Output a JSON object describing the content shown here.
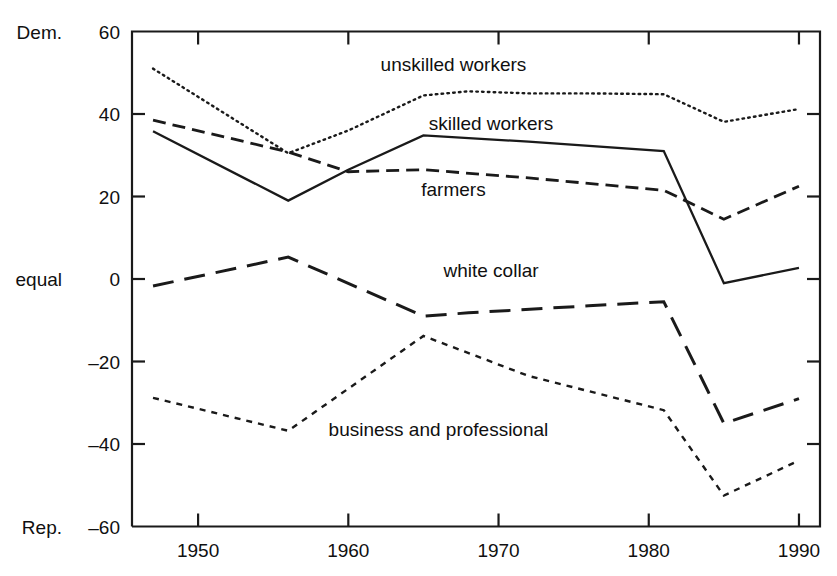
{
  "chart_data": {
    "type": "line",
    "title": "",
    "subtitle": "",
    "xlabel": "",
    "ylabel": "",
    "xlim": [
      1945.6,
      1991.4
    ],
    "ylim": [
      -60,
      60
    ],
    "grid": false,
    "legend_position": "inline-annotations",
    "x_ticks": [
      "1950",
      "1960",
      "1970",
      "1980",
      "1990"
    ],
    "x_tick_values": [
      1950,
      1960,
      1970,
      1980,
      1990
    ],
    "y_ticks": [
      "60",
      "40",
      "20",
      "0",
      "-20",
      "-40",
      "-60"
    ],
    "y_tick_values": [
      60,
      40,
      20,
      0,
      -20,
      -40,
      -60
    ],
    "y_axis_top_name": "Dem.",
    "y_axis_mid_name": "equal",
    "y_axis_bottom_name": "Rep.",
    "series": [
      {
        "name": "unskilled workers",
        "style": "dotted",
        "label_x": 1967.0,
        "label_y": 52.0,
        "x": [
          1947,
          1956,
          1960,
          1965,
          1968,
          1972,
          1976,
          1981,
          1985,
          1990
        ],
        "y": [
          51.0,
          30.5,
          36.0,
          44.5,
          45.5,
          45.0,
          45.0,
          44.8,
          38.1,
          41.2
        ]
      },
      {
        "name": "skilled workers",
        "style": "solid",
        "label_x": 1969.5,
        "label_y": 37.5,
        "x": [
          1947,
          1956,
          1960,
          1965,
          1972,
          1981,
          1985,
          1990
        ],
        "y": [
          35.8,
          19.0,
          26.5,
          34.8,
          33.3,
          31.0,
          -1.0,
          2.7
        ]
      },
      {
        "name": "farmers",
        "style": "dashed",
        "label_x": 1967.0,
        "label_y": 21.5,
        "x": [
          1947,
          1956,
          1960,
          1965,
          1972,
          1981,
          1985,
          1990
        ],
        "y": [
          38.5,
          30.8,
          26.0,
          26.5,
          24.5,
          21.5,
          14.5,
          22.5
        ]
      },
      {
        "name": "white collar",
        "style": "long-dash",
        "label_x": 1969.5,
        "label_y": 2.0,
        "x": [
          1947,
          1956,
          1965,
          1968,
          1976,
          1981,
          1985,
          1990
        ],
        "y": [
          -1.7,
          5.3,
          -9.0,
          -8.2,
          -6.5,
          -5.5,
          -35.0,
          -29.0
        ]
      },
      {
        "name": "business and professional",
        "style": "short-dash",
        "label_x": 1966.0,
        "label_y": -36.5,
        "x": [
          1947,
          1956,
          1965,
          1972,
          1981,
          1985,
          1990
        ],
        "y": [
          -28.8,
          -36.8,
          -13.8,
          -23.5,
          -31.8,
          -52.5,
          -44.0
        ]
      }
    ]
  }
}
